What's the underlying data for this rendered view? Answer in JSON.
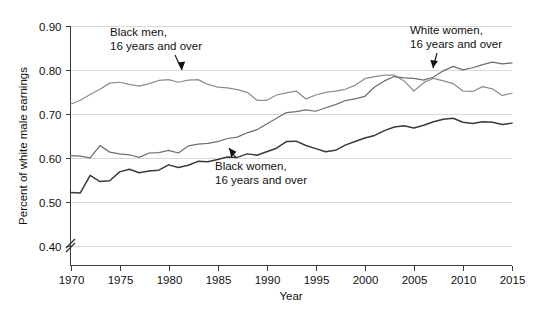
{
  "chart_data": {
    "type": "line",
    "title": "",
    "xlabel": "Year",
    "ylabel": "Percent of white male earnings",
    "xlim": [
      1970,
      2015
    ],
    "ylim": [
      0.355,
      0.9
    ],
    "y_axis_break": true,
    "grid": true,
    "legend_position": "inline-annotations",
    "xticks": [
      1970,
      1975,
      1980,
      1985,
      1990,
      1995,
      2000,
      2005,
      2010,
      2015
    ],
    "yticks": [
      0.4,
      0.5,
      0.6,
      0.7,
      0.8,
      0.9
    ],
    "ytick_labels": [
      "0.40",
      "0.50",
      "0.60",
      "0.70",
      "0.80",
      "0.90"
    ],
    "xtick_labels": [
      "1970",
      "1975",
      "1980",
      "1985",
      "1990",
      "1995",
      "2000",
      "2005",
      "2010",
      "2015"
    ],
    "x": [
      1970,
      1971,
      1972,
      1973,
      1974,
      1975,
      1976,
      1977,
      1978,
      1979,
      1980,
      1981,
      1982,
      1983,
      1984,
      1985,
      1986,
      1987,
      1988,
      1989,
      1990,
      1991,
      1992,
      1993,
      1994,
      1995,
      1996,
      1997,
      1998,
      1999,
      2000,
      2001,
      2002,
      2003,
      2004,
      2005,
      2006,
      2007,
      2008,
      2009,
      2010,
      2011,
      2012,
      2013,
      2014,
      2015
    ],
    "series": [
      {
        "name": "Black men, 16 years and over",
        "color": "#8d8d8d",
        "values": [
          0.722,
          0.731,
          0.744,
          0.756,
          0.77,
          0.772,
          0.767,
          0.763,
          0.769,
          0.776,
          0.778,
          0.772,
          0.777,
          0.778,
          0.767,
          0.761,
          0.759,
          0.755,
          0.749,
          0.731,
          0.731,
          0.743,
          0.748,
          0.752,
          0.734,
          0.743,
          0.749,
          0.752,
          0.756,
          0.765,
          0.78,
          0.785,
          0.788,
          0.788,
          0.775,
          0.752,
          0.771,
          0.781,
          0.775,
          0.769,
          0.752,
          0.751,
          0.762,
          0.757,
          0.742,
          0.747
        ]
      },
      {
        "name": "White women, 16 years and over",
        "color": "#6e6e6e",
        "values": [
          0.605,
          0.604,
          0.6,
          0.628,
          0.613,
          0.609,
          0.607,
          0.601,
          0.611,
          0.612,
          0.617,
          0.611,
          0.627,
          0.631,
          0.633,
          0.637,
          0.644,
          0.647,
          0.657,
          0.664,
          0.677,
          0.69,
          0.703,
          0.705,
          0.709,
          0.706,
          0.714,
          0.721,
          0.73,
          0.734,
          0.74,
          0.761,
          0.775,
          0.785,
          0.782,
          0.781,
          0.777,
          0.784,
          0.798,
          0.808,
          0.8,
          0.805,
          0.812,
          0.818,
          0.814,
          0.816
        ]
      },
      {
        "name": "Black women, 16 years and over",
        "color": "#3a3a3a",
        "values": [
          0.521,
          0.52,
          0.56,
          0.546,
          0.548,
          0.568,
          0.574,
          0.566,
          0.57,
          0.572,
          0.584,
          0.578,
          0.583,
          0.592,
          0.591,
          0.596,
          0.602,
          0.601,
          0.609,
          0.606,
          0.614,
          0.622,
          0.637,
          0.638,
          0.628,
          0.621,
          0.614,
          0.617,
          0.629,
          0.637,
          0.645,
          0.651,
          0.662,
          0.67,
          0.673,
          0.668,
          0.674,
          0.682,
          0.688,
          0.69,
          0.681,
          0.678,
          0.682,
          0.681,
          0.676,
          0.679
        ]
      }
    ],
    "annotations": [
      {
        "id": "black-men",
        "line1": "Black men,",
        "line2": "16 years and over"
      },
      {
        "id": "white-women",
        "line1": "White women,",
        "line2": "16 years and over"
      },
      {
        "id": "black-women",
        "line1": "Black women,",
        "line2": "16 years and over"
      }
    ]
  }
}
